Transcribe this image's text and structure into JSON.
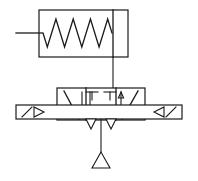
{
  "diagram": {
    "type": "fluid-power-schematic",
    "stroke_color": "#1a1a1a",
    "background_color": "#ffffff",
    "canvas": {
      "width": 198,
      "height": 181
    },
    "actuator": {
      "name": "spring-return-actuator",
      "box": {
        "x": 39,
        "y": 10,
        "width": 89,
        "height": 47
      },
      "divider_x": 113,
      "spring": {
        "name": "spring-coil",
        "start_x": 43,
        "end_x": 112,
        "center_y": 33,
        "amplitude": 14,
        "zigzags": 4
      },
      "input_line": {
        "x1": 16,
        "y1": 33,
        "x2": 42,
        "y2": 33
      }
    },
    "pilot_line": {
      "name": "pilot-signal-line",
      "x1": 113,
      "y1": 57,
      "x2": 113,
      "y2": 88
    },
    "valve_body": {
      "name": "valve-body",
      "box": {
        "x": 57,
        "y": 88,
        "width": 88,
        "height": 32
      },
      "dividers_x": [
        86,
        116
      ],
      "chambers": [
        {
          "name": "left-chamber",
          "flow": "crossed-diagonal-down"
        },
        {
          "name": "center-chamber",
          "flow": "blocked-tees"
        },
        {
          "name": "right-chamber",
          "flow": "crossed-diagonal-up"
        }
      ]
    },
    "port_plate": {
      "name": "port-plate",
      "box": {
        "x": 16,
        "y": 105,
        "width": 166,
        "height": 14
      }
    },
    "left_port": {
      "name": "left-port-arrow",
      "diagonal": {
        "x1": 22,
        "y1": 117,
        "x2": 32,
        "y2": 107
      },
      "triangle": [
        [
          34,
          107
        ],
        [
          34,
          117
        ],
        [
          44,
          112
        ]
      ]
    },
    "right_port": {
      "name": "right-port-arrow",
      "triangle": [
        [
          164,
          107
        ],
        [
          164,
          117
        ],
        [
          154,
          112
        ]
      ],
      "diagonal": {
        "x1": 166,
        "y1": 117,
        "x2": 176,
        "y2": 107
      }
    },
    "exhaust": {
      "name": "exhaust-vent",
      "drop_line": {
        "x1": 101,
        "y1": 119,
        "x2": 101,
        "y2": 155
      },
      "triangle": [
        [
          101,
          152
        ],
        [
          92,
          168
        ],
        [
          110,
          168
        ]
      ]
    },
    "exhaust_arrows": [
      {
        "name": "exhaust-arrow-left",
        "triangle": [
          [
            86,
            119
          ],
          [
            96,
            119
          ],
          [
            91,
            129
          ]
        ]
      },
      {
        "name": "exhaust-arrow-right",
        "triangle": [
          [
            106,
            119
          ],
          [
            116,
            119
          ],
          [
            111,
            129
          ]
        ]
      }
    ],
    "tee_marks": [
      {
        "name": "tee-mark-left-top",
        "x": 92,
        "y": 92,
        "width": 12,
        "stem": 8,
        "dir": "down"
      },
      {
        "name": "tee-mark-right-top",
        "x": 110,
        "y": 92,
        "width": 12,
        "stem": 8,
        "dir": "down"
      },
      {
        "name": "tee-mark-left-bottom",
        "x": 62,
        "y": 116,
        "width": 10,
        "stem": 7,
        "dir": "up"
      },
      {
        "name": "tee-mark-c1-bottom",
        "x": 88,
        "y": 116,
        "width": 10,
        "stem": 7,
        "dir": "up"
      },
      {
        "name": "tee-mark-c2-bottom",
        "x": 99,
        "y": 116,
        "width": 10,
        "stem": 7,
        "dir": "up"
      },
      {
        "name": "tee-mark-c3-bottom",
        "x": 110,
        "y": 116,
        "width": 10,
        "stem": 7,
        "dir": "up"
      },
      {
        "name": "tee-mark-right-bottom",
        "x": 139,
        "y": 116,
        "width": 10,
        "stem": 7,
        "dir": "up"
      }
    ],
    "flow_arrows": [
      {
        "name": "flow-arrow-left-down",
        "x": 82,
        "y_top": 92,
        "y_bottom": 117
      },
      {
        "name": "flow-arrow-center-down",
        "x": 90,
        "y_top": 92,
        "y_bottom": 117
      },
      {
        "name": "flow-arrow-right-up",
        "x": 121,
        "y_top": 117,
        "y_bottom": 92
      }
    ]
  }
}
